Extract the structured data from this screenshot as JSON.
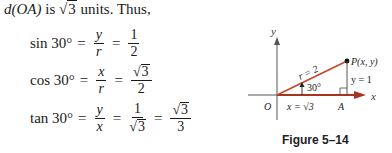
{
  "intro": {
    "prefix": "d(OA)",
    "mid": " is ",
    "radicand": "3",
    "suffix": " units. Thus,"
  },
  "equations": [
    {
      "fn": "sin 30°",
      "eq": "=",
      "frac1": {
        "num": "y",
        "den": "r"
      },
      "eq2": "=",
      "frac2": {
        "num": "1",
        "den": "2"
      }
    },
    {
      "fn": "cos 30°",
      "eq": "=",
      "frac1": {
        "num": "x",
        "den": "r"
      },
      "eq2": "=",
      "frac2": {
        "num_sqrt": "3",
        "den": "2"
      }
    },
    {
      "fn": "tan 30°",
      "eq": "=",
      "frac1": {
        "num": "y",
        "den": "x"
      },
      "eq2": "=",
      "frac2": {
        "num": "1",
        "den_sqrt": "3"
      },
      "eq3": "=",
      "frac3": {
        "num_sqrt": "3",
        "den": "3"
      }
    }
  ],
  "figure": {
    "y_axis_label": "y",
    "x_axis_label": "x",
    "origin_label": "O",
    "point_label": "P(x, y)",
    "r_label": "r = 2",
    "angle_label": "30°",
    "y_side_label": "y = 1",
    "x_side_label": "x = √3",
    "a_label": "A",
    "caption": "Figure 5–14",
    "colors": {
      "ray": "#c8452c",
      "axis": "#555555"
    }
  }
}
